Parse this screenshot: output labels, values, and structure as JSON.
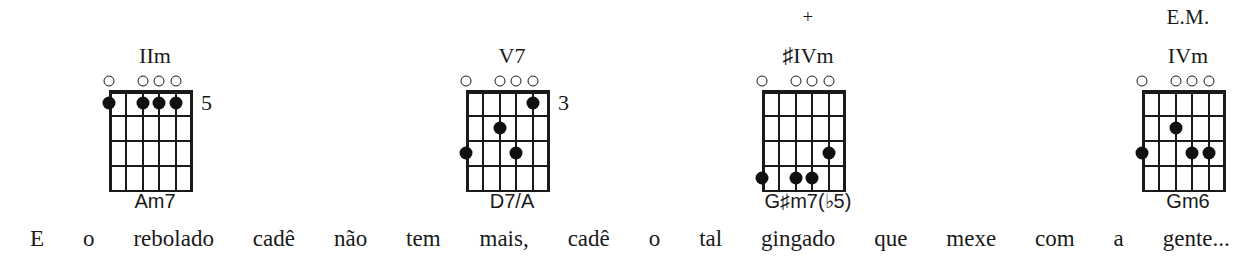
{
  "page": {
    "background": "#ffffff",
    "ink": "#1a1a1a"
  },
  "chords": [
    {
      "id": "chord-1",
      "roman": "IIm",
      "topnote": "",
      "name": "Am7",
      "fret_marker": "5",
      "left": 55,
      "open_strings": [
        6,
        4,
        3,
        2
      ],
      "muted_strings": [
        5,
        1
      ],
      "dots": [
        {
          "string": 6,
          "fret": 1
        },
        {
          "string": 4,
          "fret": 1
        },
        {
          "string": 3,
          "fret": 1
        },
        {
          "string": 2,
          "fret": 1
        }
      ]
    },
    {
      "id": "chord-2",
      "roman": "V7",
      "topnote": "",
      "name": "D7/A",
      "fret_marker": "3",
      "left": 412,
      "open_strings": [
        6,
        4,
        3,
        2
      ],
      "muted_strings": [
        5,
        1
      ],
      "dots": [
        {
          "string": 2,
          "fret": 1
        },
        {
          "string": 4,
          "fret": 2
        },
        {
          "string": 6,
          "fret": 3
        },
        {
          "string": 3,
          "fret": 3
        }
      ]
    },
    {
      "id": "chord-3",
      "roman": "♯IVm",
      "topnote": "+",
      "name": "G♯m7(♭5)",
      "fret_marker": "",
      "left": 708,
      "open_strings": [
        6,
        4,
        3,
        2
      ],
      "muted_strings": [
        5,
        1
      ],
      "dots": [
        {
          "string": 2,
          "fret": 3
        },
        {
          "string": 6,
          "fret": 4
        },
        {
          "string": 4,
          "fret": 4
        },
        {
          "string": 3,
          "fret": 4
        }
      ]
    },
    {
      "id": "chord-4",
      "roman": "IVm",
      "topnote": "E.M.",
      "name": "Gm6",
      "fret_marker": "",
      "left": 1088,
      "open_strings": [
        6,
        4,
        3,
        2
      ],
      "muted_strings": [
        5,
        1
      ],
      "dots": [
        {
          "string": 4,
          "fret": 2
        },
        {
          "string": 6,
          "fret": 3
        },
        {
          "string": 3,
          "fret": 3
        },
        {
          "string": 2,
          "fret": 3
        }
      ]
    }
  ],
  "lyrics": {
    "full_line": "E o rebolado cadê não tem mais, cadê o tal gingado que mexe com a gente...",
    "words": [
      "E",
      "o",
      "rebolado",
      "cadê",
      "não",
      "tem",
      "mais,",
      "cadê",
      "o",
      "tal",
      "gingado",
      "que",
      "mexe",
      "com",
      "a",
      "gente..."
    ]
  }
}
